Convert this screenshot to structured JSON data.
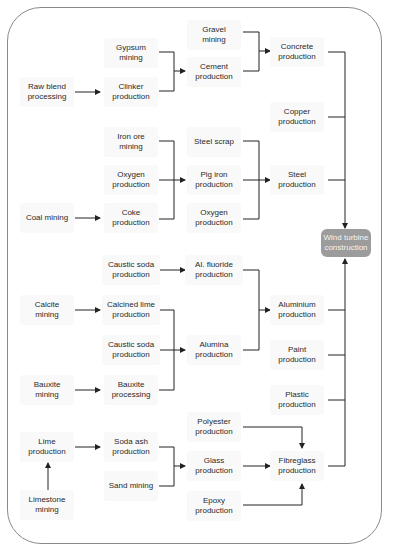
{
  "diagram": {
    "target": {
      "id": "wind",
      "label": "Wind turbine\nconstruction",
      "x": 346,
      "y": 243
    },
    "nodes": [
      {
        "id": "gypsum",
        "label": "Gypsum\nmining",
        "x": 131,
        "y": 53
      },
      {
        "id": "rawblend",
        "label": "Raw blend\nprocessing",
        "x": 47,
        "y": 92
      },
      {
        "id": "clinker",
        "label": "Clinker\nproduction",
        "x": 131,
        "y": 92
      },
      {
        "id": "gravel",
        "label": "Gravel\nmining",
        "x": 214,
        "y": 35
      },
      {
        "id": "cement",
        "label": "Cement\nproduction",
        "x": 214,
        "y": 72
      },
      {
        "id": "concrete",
        "label": "Concrete\nproduction",
        "x": 297,
        "y": 52
      },
      {
        "id": "copper",
        "label": "Copper\nproduction",
        "x": 297,
        "y": 117
      },
      {
        "id": "ironore",
        "label": "Iron ore\nmining",
        "x": 131,
        "y": 142
      },
      {
        "id": "oxygen1",
        "label": "Oxygen\nproduction",
        "x": 131,
        "y": 180
      },
      {
        "id": "coal",
        "label": "Coal mining",
        "x": 47,
        "y": 218
      },
      {
        "id": "coke",
        "label": "Coke\nproduction",
        "x": 131,
        "y": 218
      },
      {
        "id": "steelscrap",
        "label": "Steel scrap",
        "x": 214,
        "y": 142
      },
      {
        "id": "pigiron",
        "label": "Pig iron\nproduction",
        "x": 214,
        "y": 180
      },
      {
        "id": "oxygen2",
        "label": "Oxygen\nproduction",
        "x": 214,
        "y": 218
      },
      {
        "id": "steel",
        "label": "Steel\nproduction",
        "x": 297,
        "y": 180
      },
      {
        "id": "caustic1",
        "label": "Caustic soda\nproduction",
        "x": 131,
        "y": 270
      },
      {
        "id": "alfluoride",
        "label": "Al. fluoride\nproduction",
        "x": 214,
        "y": 270
      },
      {
        "id": "calcite",
        "label": "Calcite\nmining",
        "x": 47,
        "y": 310
      },
      {
        "id": "calcined",
        "label": "Calcined lime\nproduction",
        "x": 131,
        "y": 310
      },
      {
        "id": "caustic2",
        "label": "Caustic soda\nproduction",
        "x": 131,
        "y": 350
      },
      {
        "id": "bauxite",
        "label": "Bauxite\nmining",
        "x": 47,
        "y": 390
      },
      {
        "id": "bauxproc",
        "label": "Bauxite\nprocessing",
        "x": 131,
        "y": 390
      },
      {
        "id": "alumina",
        "label": "Alumina\nproduction",
        "x": 214,
        "y": 350
      },
      {
        "id": "aluminium",
        "label": "Aluminium\nproduction",
        "x": 297,
        "y": 310
      },
      {
        "id": "paint",
        "label": "Paint\nproduction",
        "x": 297,
        "y": 355
      },
      {
        "id": "plastic",
        "label": "Plastic\nproduction",
        "x": 297,
        "y": 400
      },
      {
        "id": "lime",
        "label": "Lime\nproduction",
        "x": 47,
        "y": 447
      },
      {
        "id": "limestone",
        "label": "Limestone\nmining",
        "x": 47,
        "y": 505
      },
      {
        "id": "sodaash",
        "label": "Soda ash\nproduction",
        "x": 131,
        "y": 447
      },
      {
        "id": "sand",
        "label": "Sand mining",
        "x": 131,
        "y": 486
      },
      {
        "id": "polyester",
        "label": "Polyester\nproduction",
        "x": 214,
        "y": 427
      },
      {
        "id": "glass",
        "label": "Glass\nproduction",
        "x": 214,
        "y": 466
      },
      {
        "id": "epoxy",
        "label": "Epoxy\nproduction",
        "x": 214,
        "y": 506
      },
      {
        "id": "fibreglass",
        "label": "Fibreglass\nproduction",
        "x": 297,
        "y": 466
      }
    ],
    "edges": [
      {
        "from": [
          "rawblend"
        ],
        "to": "clinker"
      },
      {
        "from": [
          "gypsum",
          "clinker"
        ],
        "to": "cement"
      },
      {
        "from": [
          "gravel",
          "cement"
        ],
        "to": "concrete"
      },
      {
        "from": [
          "coal"
        ],
        "to": "coke"
      },
      {
        "from": [
          "ironore",
          "oxygen1",
          "coke"
        ],
        "to": "pigiron"
      },
      {
        "from": [
          "steelscrap",
          "pigiron",
          "oxygen2"
        ],
        "to": "steel"
      },
      {
        "from": [
          "caustic1"
        ],
        "to": "alfluoride"
      },
      {
        "from": [
          "calcite"
        ],
        "to": "calcined"
      },
      {
        "from": [
          "bauxite"
        ],
        "to": "bauxproc"
      },
      {
        "from": [
          "calcined",
          "caustic2",
          "bauxproc"
        ],
        "to": "alumina"
      },
      {
        "from": [
          "alfluoride",
          "alumina"
        ],
        "to": "aluminium"
      },
      {
        "from": [
          "limestone"
        ],
        "to": "lime"
      },
      {
        "from": [
          "lime"
        ],
        "to": "sodaash"
      },
      {
        "from": [
          "sodaash",
          "sand"
        ],
        "to": "glass"
      },
      {
        "from": [
          "polyester",
          "glass",
          "epoxy"
        ],
        "to": "fibreglass"
      },
      {
        "from": [
          "concrete",
          "copper",
          "steel"
        ],
        "to": "wind"
      },
      {
        "from": [
          "aluminium",
          "paint",
          "plastic",
          "fibreglass"
        ],
        "to": "wind"
      }
    ],
    "colors": {
      "line": "#222222",
      "node_bg": "#f9f9f9",
      "target_bg": "#9c9c9c",
      "frame": "#8a8a8a"
    }
  }
}
